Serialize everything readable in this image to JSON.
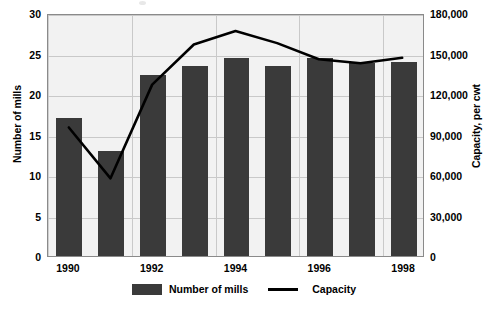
{
  "chart_data": {
    "type": "bar",
    "title": "",
    "subtitle": "",
    "xlabel": "",
    "ylabel": "Number of mills",
    "y2label": "Capacity, per cwt",
    "categories": [
      "1990",
      "1991",
      "1992",
      "1993",
      "1994",
      "1995",
      "1996",
      "1997",
      "1998"
    ],
    "x_tick_labels": [
      "1990",
      "",
      "1992",
      "",
      "1994",
      "",
      "1996",
      "",
      "1998"
    ],
    "ylim": [
      0,
      30
    ],
    "y_ticks": [
      0,
      5,
      10,
      15,
      20,
      25,
      30
    ],
    "y_tick_labels": [
      "0",
      "5",
      "10",
      "15",
      "20",
      "25",
      "30"
    ],
    "y2lim": [
      0,
      180000
    ],
    "y2_ticks": [
      0,
      30000,
      60000,
      90000,
      120000,
      150000,
      180000
    ],
    "y2_tick_labels": [
      "0",
      "30,000",
      "60,000",
      "90,000",
      "120,000",
      "150,000",
      "180,000"
    ],
    "grid": true,
    "legend_position": "bottom-center",
    "series": [
      {
        "name": "Number of mills",
        "type": "bar",
        "axis": "left",
        "color": "#3a3a3a",
        "values": [
          17,
          13,
          22.3,
          23.5,
          24.5,
          23.5,
          24.5,
          23.8,
          24
        ]
      },
      {
        "name": "Capacity",
        "type": "line",
        "axis": "right",
        "color": "#000000",
        "values": [
          96000,
          58000,
          128000,
          158000,
          168000,
          159000,
          147000,
          144000,
          148000
        ]
      }
    ]
  },
  "legend": {
    "entries": [
      {
        "label": "Number of mills",
        "marker": "bar-swatch"
      },
      {
        "label": "Capacity",
        "marker": "line-swatch"
      }
    ]
  }
}
